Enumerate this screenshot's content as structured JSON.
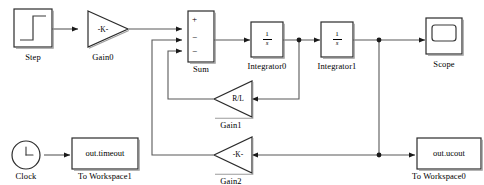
{
  "diagram": {
    "background_color": "#ffffff",
    "line_color": "#595959",
    "block_border_color": "#2b2b2b",
    "text_color": "#000000",
    "blocks": [
      {
        "id": "step",
        "name": "Step",
        "label": "Step",
        "type": "source-step",
        "icon": "step-waveform-icon"
      },
      {
        "id": "gain0",
        "name": "Gain0",
        "label": "Gain0",
        "type": "gain-triangle",
        "value": "-K-",
        "direction": "right"
      },
      {
        "id": "sum",
        "name": "Sum",
        "label": "Sum",
        "type": "sum",
        "signs": [
          "+",
          "−",
          "−"
        ]
      },
      {
        "id": "integrator0",
        "name": "Integrator0",
        "label": "Integrator0",
        "type": "integrator",
        "numerator": "1",
        "denominator": "s"
      },
      {
        "id": "integrator1",
        "name": "Integrator1",
        "label": "Integrator1",
        "type": "integrator",
        "numerator": "1",
        "denominator": "s"
      },
      {
        "id": "scope",
        "name": "Scope",
        "label": "Scope",
        "type": "scope",
        "icon": "scope-screen-icon"
      },
      {
        "id": "gain1",
        "name": "Gain1",
        "label": "Gain1",
        "type": "gain-triangle",
        "value": "R/L",
        "direction": "left"
      },
      {
        "id": "gain2",
        "name": "Gain2",
        "label": "Gain2",
        "type": "gain-triangle",
        "value": "-K-",
        "direction": "left"
      },
      {
        "id": "clock",
        "name": "Clock",
        "label": "Clock",
        "type": "clock",
        "icon": "clock-face-icon"
      },
      {
        "id": "toworkspace1",
        "name": "To Workspace1",
        "label": "To Workspace1",
        "type": "to-workspace",
        "variable": "out.timeout"
      },
      {
        "id": "toworkspace0",
        "name": "To Workspace0",
        "label": "To Workspace0",
        "type": "to-workspace",
        "variable": "out.ucout"
      }
    ],
    "signals": [
      {
        "from": "step",
        "to": "gain0",
        "name": "step-to-gain0"
      },
      {
        "from": "gain0",
        "to": "sum",
        "name": "gain0-to-sum-input1"
      },
      {
        "from": "sum",
        "to": "integrator0",
        "name": "sum-to-integrator0"
      },
      {
        "from": "integrator0",
        "to": "integrator1",
        "name": "integrator0-to-integrator1"
      },
      {
        "from": "integrator1",
        "to": "scope",
        "name": "integrator1-to-scope"
      },
      {
        "from": "integrator0",
        "to": "gain1",
        "name": "integrator0-branch-to-gain1"
      },
      {
        "from": "gain1",
        "to": "sum",
        "name": "gain1-to-sum-input3"
      },
      {
        "from": "integrator1",
        "to": "gain2",
        "name": "integrator1-branch-to-gain2"
      },
      {
        "from": "gain2",
        "to": "sum",
        "name": "gain2-to-sum-input2"
      },
      {
        "from": "integrator1",
        "to": "toworkspace0",
        "name": "integrator1-to-toworkspace0"
      },
      {
        "from": "clock",
        "to": "toworkspace1",
        "name": "clock-to-toworkspace1"
      }
    ],
    "junctions": [
      {
        "name": "junction-integrator0-output",
        "x": 299,
        "y": 40
      },
      {
        "name": "junction-integrator1-output",
        "x": 379,
        "y": 40
      },
      {
        "name": "junction-gain2-feedback",
        "x": 379,
        "y": 155
      }
    ]
  }
}
